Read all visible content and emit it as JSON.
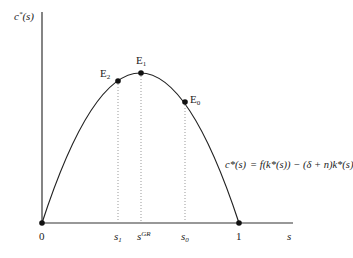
{
  "diagram": {
    "y_axis_label": {
      "base": "c",
      "sup": "*",
      "arg": "(s)"
    },
    "x_axis_label": "s",
    "origin_label": "0",
    "x_ticks": [
      {
        "id": "s1",
        "base": "s",
        "sub": "1",
        "x": 118
      },
      {
        "id": "sGR",
        "base": "s",
        "sup": "GR",
        "x": 141
      },
      {
        "id": "s0",
        "base": "s",
        "sub": "0",
        "x": 185
      },
      {
        "id": "one",
        "base": "1",
        "x": 239
      }
    ],
    "points": [
      {
        "id": "E2",
        "label": "E",
        "sub": "2",
        "x": 118,
        "y": 81
      },
      {
        "id": "E1",
        "label": "E",
        "sub": "1",
        "x": 141,
        "y": 73
      },
      {
        "id": "E0",
        "label": "E",
        "sub": "0",
        "x": 185,
        "y": 102
      }
    ],
    "equation": {
      "lhs": "c*(s)",
      "rhs": "= f(k*(s)) − (δ + n)k*(s)"
    },
    "colors": {
      "curve": "#222222",
      "axis": "#333333",
      "guide": "#999999"
    }
  }
}
